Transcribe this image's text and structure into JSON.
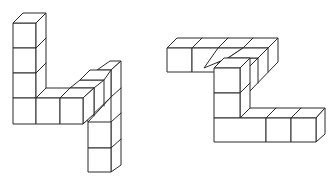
{
  "figures": [
    {
      "id": "figure-left",
      "description": "Left cube structure: vertical column of 4, bottom row of 3, depth row going back, hanging column",
      "cube_count_visible": 11
    },
    {
      "id": "figure-right",
      "description": "Right cube structure: top row, depth row, vertical column, bottom row",
      "cube_count_visible": 12
    }
  ],
  "colors": {
    "stroke": "#2a2a2a",
    "fill": "#ffffff",
    "background": "#ffffff"
  }
}
